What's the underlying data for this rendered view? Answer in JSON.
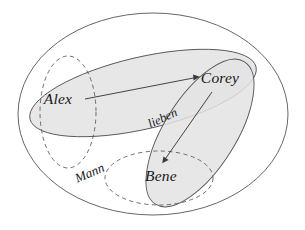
{
  "diagram": {
    "type": "set-diagram",
    "canvas": {
      "width": 305,
      "height": 230,
      "background": "#ffffff"
    },
    "colors": {
      "stroke": "#55555b",
      "shade_fill": "#e3e3e3",
      "arrow": "#3a3a40",
      "text": "#17171a",
      "background": "#ffffff"
    },
    "sets": [
      {
        "id": "universe",
        "label": "",
        "style": "solid",
        "shaded": false,
        "shape": "ellipse",
        "cx": 153,
        "cy": 114,
        "rx": 135,
        "ry": 101,
        "rotate": 0
      },
      {
        "id": "lieben",
        "label": "lieben",
        "style": "solid",
        "shaded": true,
        "shape": "ellipse",
        "cx": 143,
        "cy": 93,
        "rx": 116,
        "ry": 36,
        "rotate": -13
      },
      {
        "id": "frau",
        "label": "",
        "style": "solid",
        "shaded": true,
        "shape": "ellipse",
        "cx": 200,
        "cy": 133,
        "rx": 84,
        "ry": 36,
        "rotate": -58
      },
      {
        "id": "mann",
        "label": "Mann",
        "style": "dashed",
        "shaded": false,
        "shape": "ellipse",
        "cx": 68,
        "cy": 112,
        "rx": 28,
        "ry": 56,
        "rotate": 0
      },
      {
        "id": "bene-set",
        "label": "",
        "style": "dashed",
        "shaded": false,
        "shape": "ellipse",
        "cx": 159,
        "cy": 178,
        "rx": 54,
        "ry": 27,
        "rotate": 0
      }
    ],
    "entities": [
      {
        "id": "alex",
        "label": "Alex",
        "x": 58,
        "y": 100
      },
      {
        "id": "corey",
        "label": "Corey",
        "x": 218,
        "y": 79
      },
      {
        "id": "bene",
        "label": "Bene",
        "x": 160,
        "y": 177
      }
    ],
    "relation_labels": [
      {
        "id": "lieben-label",
        "label": "lieben",
        "x": 163,
        "y": 119,
        "rotate": -25
      },
      {
        "id": "mann-label",
        "label": "Mann",
        "x": 90,
        "y": 174,
        "rotate": -23
      }
    ],
    "arrows": [
      {
        "id": "alex-loves-corey",
        "from": "alex",
        "to": "corey",
        "x1": 85,
        "y1": 99,
        "x2": 199,
        "y2": 77
      },
      {
        "id": "corey-loves-bene",
        "from": "corey",
        "to": "bene",
        "x1": 212,
        "y1": 92,
        "x2": 163,
        "y2": 163
      }
    ]
  }
}
